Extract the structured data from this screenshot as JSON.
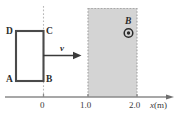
{
  "figure": {
    "colors": {
      "loop_stroke": "#4a4a4a",
      "field_fill": "#d4d4d4",
      "field_border": "#a8a8a8",
      "axis": "#8a8a8a",
      "dotted_guide": "#b5b5b5",
      "text": "#2b2b2b",
      "arrow": "#3a3a3a"
    },
    "loop": {
      "corner_labels": {
        "top_left": "D",
        "top_right": "C",
        "bottom_left": "A",
        "bottom_right": "B"
      }
    },
    "velocity": {
      "label": "v",
      "direction": "right"
    },
    "field": {
      "label": "B",
      "symbol": "out-of-page-dot",
      "region_start": "1.0",
      "region_end": "2.0"
    },
    "axis": {
      "label_variable": "x",
      "label_unit": "(m)",
      "ticks": [
        {
          "value": "0",
          "x": 43
        },
        {
          "value": "1.0",
          "x": 88
        },
        {
          "value": "2.0",
          "x": 137
        }
      ]
    }
  }
}
